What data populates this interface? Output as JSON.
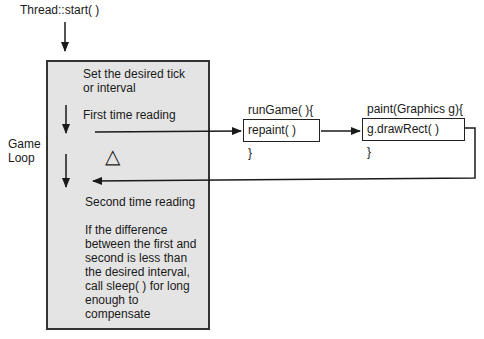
{
  "start_label": "Thread::start( )",
  "side_label": "Game\nLoop",
  "side_label_lines": [
    "Game",
    "Loop"
  ],
  "main_box": {
    "step1_lines": [
      "Set the desired tick",
      "or interval"
    ],
    "step2": "First time reading",
    "delta_symbol": "△",
    "step3": "Second time reading",
    "step4_lines": [
      "If the difference",
      "between the first and",
      "second is less than",
      "the desired interval,",
      "call sleep( ) for long",
      "enough to",
      "compensate"
    ]
  },
  "run_game": {
    "header": "runGame( ){",
    "body": "repaint( )",
    "footer": "}"
  },
  "paint": {
    "header": "paint(Graphics g){",
    "body": "g.drawRect( )",
    "footer": "}"
  },
  "colors": {
    "box_fill": "#e4e4e4",
    "line": "#222222"
  }
}
